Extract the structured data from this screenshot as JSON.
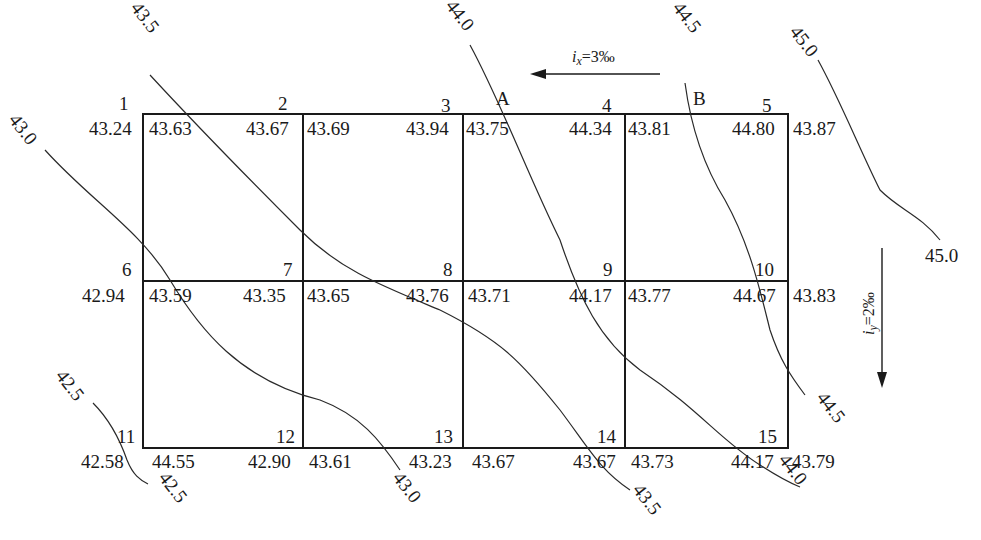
{
  "figure": {
    "type": "site-grading-grid",
    "grid": {
      "columns": 4,
      "rows": 2,
      "corner_count": 15
    },
    "corners": [
      {
        "id": "1",
        "natural": "43.24",
        "design_left": "",
        "design_right": "43.63"
      },
      {
        "id": "2",
        "natural": "43.67",
        "design_right": "43.69"
      },
      {
        "id": "3",
        "natural": "43.94",
        "design_right": "43.75"
      },
      {
        "id": "4",
        "natural": "44.34",
        "design_right": "43.81"
      },
      {
        "id": "5",
        "natural": "44.80",
        "design_right": "43.87"
      },
      {
        "id": "6",
        "natural": "42.94",
        "design_right": "43.59"
      },
      {
        "id": "7",
        "natural": "43.35",
        "design_right": "43.65"
      },
      {
        "id": "8",
        "natural": "43.76",
        "design_right": "43.71"
      },
      {
        "id": "9",
        "natural": "44.17",
        "design_right": "43.77"
      },
      {
        "id": "10",
        "natural": "44.67",
        "design_right": "43.83"
      },
      {
        "id": "11",
        "natural": "42.58",
        "design_right": "44.55"
      },
      {
        "id": "12",
        "natural": "42.90",
        "design_right": "43.61"
      },
      {
        "id": "13",
        "natural": "43.23",
        "design_right": "43.67"
      },
      {
        "id": "14",
        "natural": "43.67",
        "design_right": "43.73"
      },
      {
        "id": "15",
        "natural": "44.17",
        "design_right": "43.79"
      }
    ],
    "point_labels": {
      "A": "A",
      "B": "B"
    },
    "contours": [
      {
        "label_start": "43.0",
        "label_end": "43.0"
      },
      {
        "label_start": "43.5",
        "label_end": "43.5"
      },
      {
        "label_start": "44.0",
        "label_end": "44.0"
      },
      {
        "label_start": "44.5",
        "label_end": "44.5"
      },
      {
        "label_start": "45.0",
        "label_end": "45.0"
      },
      {
        "label_start": "42.5",
        "label_end": "42.5"
      }
    ],
    "slopes": {
      "x_label": "i",
      "x_sub": "x",
      "x_value": "=3‰",
      "y_label": "i",
      "y_sub": "y",
      "y_value": "=2‰"
    }
  }
}
